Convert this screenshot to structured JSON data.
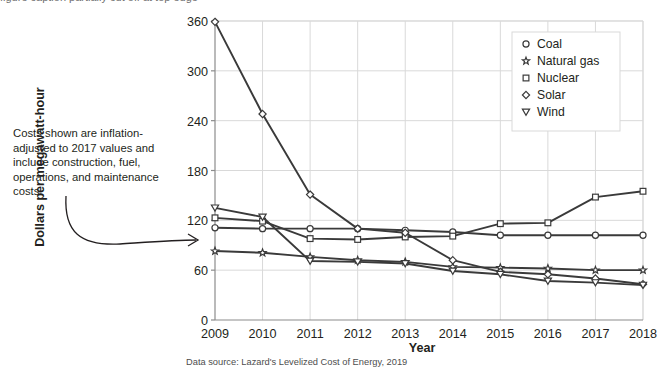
{
  "page": {
    "cut_off_title": "figure caption partially cut off at top edge",
    "annotation": "Costs shown are inflation-adjusted to 2017 values and include construction, fuel, operations, and maintenance costs.",
    "source_note": "Data source: Lazard's Levelized Cost of Energy, 2019"
  },
  "colors": {
    "background": "#ffffff",
    "line": "#3a3a3a",
    "grid": "#d9d9d9",
    "axis": "#8c8c8c",
    "text": "#231f20",
    "marker_fill": "#ffffff"
  },
  "chart_data": {
    "type": "line",
    "title": "",
    "xlabel": "Year",
    "ylabel": "Dollars per megawatt-hour",
    "x": [
      2009,
      2010,
      2011,
      2012,
      2013,
      2014,
      2015,
      2016,
      2017,
      2018
    ],
    "categories": [
      "2009",
      "2010",
      "2011",
      "2012",
      "2013",
      "2014",
      "2015",
      "2016",
      "2017",
      "2018"
    ],
    "xlim": [
      2009,
      2018
    ],
    "ylim": [
      0,
      360
    ],
    "yticks": [
      0,
      60,
      120,
      180,
      240,
      300,
      360
    ],
    "ytick_labels": [
      "0",
      "60",
      "120",
      "180",
      "240",
      "300",
      "360"
    ],
    "grid": true,
    "legend_position": "top-right",
    "series": [
      {
        "name": "Coal",
        "marker": "circle",
        "values": [
          111,
          110,
          110,
          110,
          108,
          106,
          102,
          102,
          102,
          102
        ]
      },
      {
        "name": "Natural gas",
        "marker": "star",
        "values": [
          83,
          81,
          76,
          72,
          70,
          64,
          63,
          62,
          60,
          60
        ]
      },
      {
        "name": "Nuclear",
        "marker": "square",
        "values": [
          123,
          119,
          98,
          97,
          100,
          101,
          116,
          117,
          148,
          155
        ]
      },
      {
        "name": "Solar",
        "marker": "diamond",
        "values": [
          359,
          248,
          151,
          110,
          105,
          72,
          58,
          55,
          50,
          43
        ]
      },
      {
        "name": "Wind",
        "marker": "triangle-down",
        "values": [
          135,
          124,
          71,
          70,
          68,
          59,
          55,
          47,
          45,
          42
        ]
      }
    ]
  }
}
